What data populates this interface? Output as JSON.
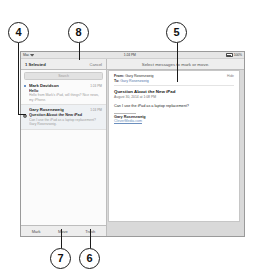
{
  "figure": {
    "callouts": [
      {
        "id": "callout-4",
        "label": "4"
      },
      {
        "id": "callout-8",
        "label": "8"
      },
      {
        "id": "callout-5",
        "label": "5"
      },
      {
        "id": "callout-7",
        "label": "7"
      },
      {
        "id": "callout-6",
        "label": "6"
      }
    ]
  },
  "statusbar": {
    "carrier": "Mac",
    "wifi_icon": "wifi-icon",
    "time": "1:24 PM",
    "battery_icon": "battery-icon",
    "battery_level": "100%"
  },
  "navbar": {
    "left_title": "1 Selected",
    "cancel_label": "Cancel",
    "right_title": "Select messages to mark or move."
  },
  "list_pane": {
    "search_placeholder": "Search",
    "messages": [
      {
        "sender": "Mark Davidson",
        "time": "1:24 PM",
        "subject": "Hello",
        "preview": "Hello from Mark's iPad, will things? Nice news, my iPhone.",
        "unread": true,
        "selected": false
      },
      {
        "sender": "Gary Rosenzweig",
        "time": "1:24 PM",
        "subject": "Question About the New iPad",
        "preview": "Can I use the iPad as a laptop replacement? Gary Rosenzweig.",
        "unread": false,
        "selected": true
      }
    ]
  },
  "detail_pane": {
    "from_label": "From:",
    "from_value": "Gary Rosenzweig",
    "to_label": "To:",
    "to_value": "Gary Rosenzweig",
    "hide_details": "Hide",
    "subject": "Question About the New iPad",
    "date": "August 30, 2014 at 1:08 PM",
    "body": "Can I use the iPad as a laptop replacement?",
    "signature_name": "Gary Rosenzweig",
    "signature_site": "CleverMedia.com"
  },
  "bottom_toolbar": {
    "buttons": [
      {
        "label": "Mark"
      },
      {
        "label": "Move"
      },
      {
        "label": "Trash"
      }
    ]
  }
}
